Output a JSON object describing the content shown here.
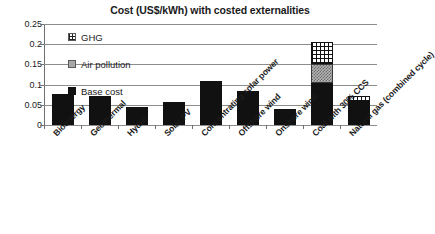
{
  "chart_data": {
    "type": "bar",
    "title": "Cost (US$/kWh) with costed externalities",
    "xlabel": "",
    "ylabel": "",
    "ylim": [
      0,
      0.25
    ],
    "yticks": [
      "0",
      "0.05",
      "0.1",
      "0.15",
      "0.2",
      "0.25"
    ],
    "ytick_values": [
      0,
      0.05,
      0.1,
      0.15,
      0.2,
      0.25
    ],
    "grid": true,
    "stacked": true,
    "legend_position": "inside-top-left",
    "categories": [
      "Bioenergy",
      "Geothermal",
      "Hydro",
      "Solar PV",
      "Concentrating solar power",
      "Offshore wind",
      "Onshore wind",
      "Coal with 30% CCS",
      "Natural gas (combined cycle)"
    ],
    "series": [
      {
        "name": "Base cost",
        "color": "#111111",
        "values": [
          0.076,
          0.071,
          0.045,
          0.057,
          0.108,
          0.084,
          0.039,
          0.105,
          0.058
        ]
      },
      {
        "name": "Air pollution",
        "color": "#b3b3b3",
        "values": [
          0,
          0,
          0,
          0,
          0,
          0,
          0,
          0.045,
          0
        ]
      },
      {
        "name": "GHG",
        "color": "#ffffff",
        "values": [
          0,
          0,
          0,
          0,
          0,
          0,
          0,
          0.055,
          0.015
        ]
      }
    ]
  },
  "legend": {
    "entries": [
      {
        "label": "GHG",
        "swatch": "ghg-checkered-swatch"
      },
      {
        "label": "Air pollution",
        "swatch": "air-pollution-gray-swatch"
      },
      {
        "label": "Base cost",
        "swatch": "base-cost-black-swatch"
      }
    ]
  }
}
